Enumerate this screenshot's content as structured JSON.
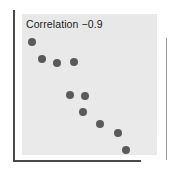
{
  "figure": {
    "width": 173,
    "height": 173,
    "background_color": "#ffffff",
    "panel_color": "#e7e7e7",
    "axis_color": "#4a4a4a",
    "point_color": "#5a5a5a"
  },
  "chart_data": {
    "type": "scatter",
    "title": "Correlation  −0.9",
    "title_label": "Correlation",
    "correlation_value": "−0.9",
    "xlabel": "",
    "ylabel": "",
    "xticklabels": [],
    "yticklabels": [],
    "grid": false,
    "legend": null,
    "axis_style": "left-and-bottom-spines",
    "panel_background": "#e7e7e7",
    "point_count": 10,
    "point_radius_px": 4,
    "xlim": [
      0,
      1
    ],
    "ylim": [
      0,
      1
    ],
    "points": [
      {
        "x": 0.075,
        "y": 0.805,
        "px": 32,
        "py": 42,
        "r": 4
      },
      {
        "x": 0.15,
        "y": 0.685,
        "px": 42,
        "py": 59,
        "r": 4
      },
      {
        "x": 0.262,
        "y": 0.657,
        "px": 57,
        "py": 63,
        "r": 4
      },
      {
        "x": 0.388,
        "y": 0.664,
        "px": 74,
        "py": 62,
        "r": 4
      },
      {
        "x": 0.358,
        "y": 0.431,
        "px": 70,
        "py": 95,
        "r": 4
      },
      {
        "x": 0.47,
        "y": 0.424,
        "px": 85,
        "py": 96,
        "r": 4
      },
      {
        "x": 0.455,
        "y": 0.31,
        "px": 83,
        "py": 112,
        "r": 4
      },
      {
        "x": 0.582,
        "y": 0.225,
        "px": 100,
        "py": 124,
        "r": 4
      },
      {
        "x": 0.716,
        "y": 0.161,
        "px": 118,
        "py": 133,
        "r": 4
      },
      {
        "x": 0.776,
        "y": 0.04,
        "px": 126,
        "py": 150,
        "r": 4
      }
    ]
  }
}
